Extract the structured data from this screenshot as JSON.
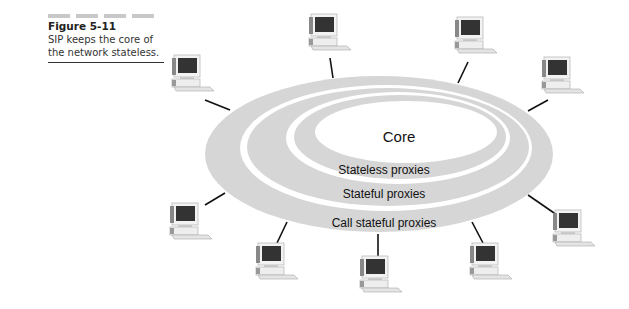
{
  "caption": {
    "figure_number": "Figure 5-11",
    "line1": "SIP keeps the core of",
    "line2": "the network stateless."
  },
  "diagram": {
    "core_label": "Core",
    "rings": [
      {
        "label": "Stateless proxies"
      },
      {
        "label": "Stateful proxies"
      },
      {
        "label": "Call stateful proxies"
      }
    ],
    "ring_color": "#d6d6d6",
    "computer_count": 10
  }
}
